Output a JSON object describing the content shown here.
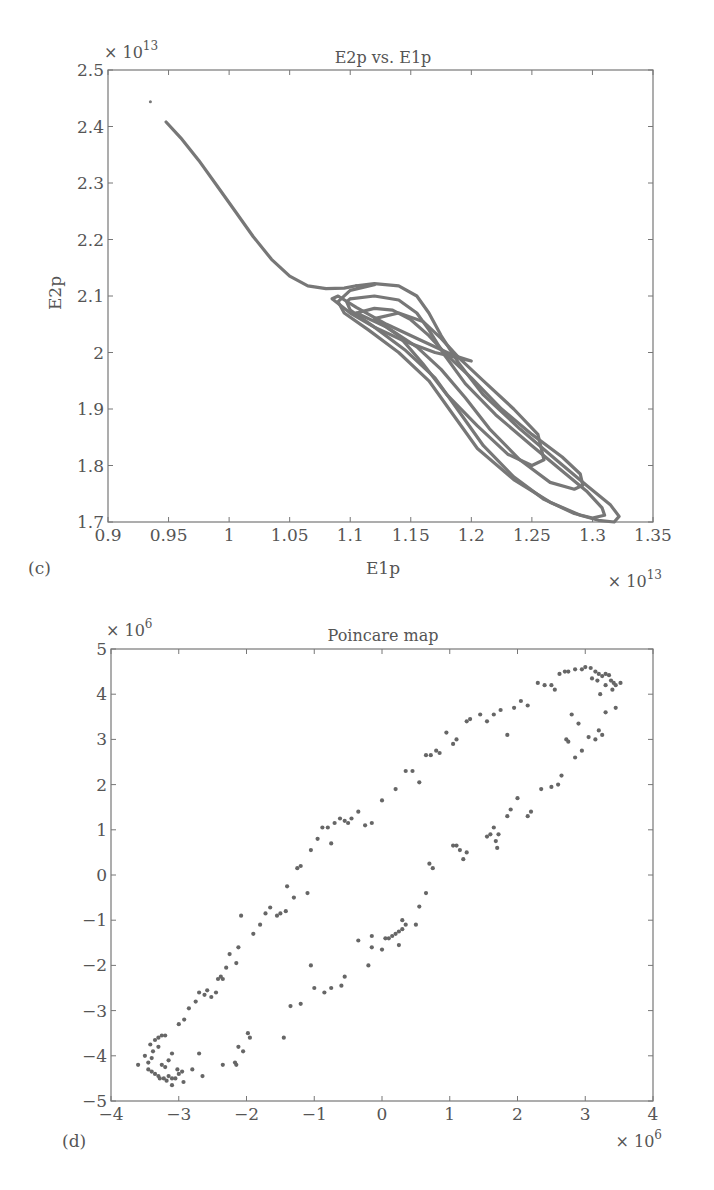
{
  "chart_data": [
    {
      "panel": "(c)",
      "type": "line",
      "title": "E2p vs. E1p",
      "xlabel": "E1p",
      "ylabel": "E2p",
      "x_multiplier": "× 10^13",
      "y_multiplier": "× 10^13",
      "xlim": [
        0.9,
        1.35
      ],
      "ylim": [
        1.7,
        2.5
      ],
      "xticks": [
        0.9,
        0.95,
        1,
        1.05,
        1.1,
        1.15,
        1.2,
        1.25,
        1.3,
        1.35
      ],
      "xtick_labels": [
        "0.9",
        "0.95",
        "1",
        "1.05",
        "1.1",
        "1.15",
        "1.2",
        "1.25",
        "1.3",
        "1.35"
      ],
      "yticks": [
        1.7,
        1.8,
        1.9,
        2.0,
        2.1,
        2.2,
        2.3,
        2.4,
        2.5
      ],
      "ytick_labels": [
        "1.7",
        "1.8",
        "1.9",
        "2",
        "2.1",
        "2.2",
        "2.3",
        "2.4",
        "2.5"
      ],
      "grid": false,
      "color": "#777777",
      "isolated_point": [
        0.935,
        2.444
      ],
      "series": [
        {
          "name": "transient",
          "x": [
            0.948,
            0.96,
            0.975,
            0.99,
            1.005,
            1.02,
            1.035,
            1.05,
            1.065,
            1.08,
            1.095,
            1.105
          ],
          "y": [
            2.408,
            2.38,
            2.34,
            2.295,
            2.25,
            2.205,
            2.165,
            2.135,
            2.118,
            2.113,
            2.114,
            2.118
          ]
        },
        {
          "name": "loop-outer",
          "x": [
            1.105,
            1.12,
            1.14,
            1.155,
            1.165,
            1.175,
            1.19,
            1.21,
            1.24,
            1.27,
            1.295,
            1.315,
            1.322,
            1.318,
            1.305,
            1.29,
            1.265,
            1.235,
            1.205,
            1.185,
            1.165,
            1.14,
            1.115,
            1.095,
            1.09,
            1.1,
            1.12
          ],
          "y": [
            2.118,
            2.122,
            2.118,
            2.1,
            2.07,
            2.03,
            1.98,
            1.925,
            1.865,
            1.81,
            1.765,
            1.73,
            1.71,
            1.7,
            1.703,
            1.712,
            1.735,
            1.775,
            1.83,
            1.89,
            1.95,
            2.0,
            2.04,
            2.07,
            2.09,
            2.11,
            2.12
          ]
        },
        {
          "name": "loop-mid",
          "x": [
            1.1,
            1.12,
            1.14,
            1.155,
            1.165,
            1.178,
            1.195,
            1.22,
            1.25,
            1.275,
            1.295,
            1.308,
            1.31,
            1.3,
            1.285,
            1.26,
            1.235,
            1.21,
            1.19,
            1.17,
            1.145,
            1.12,
            1.1,
            1.097,
            1.1
          ],
          "y": [
            2.095,
            2.1,
            2.093,
            2.07,
            2.04,
            1.995,
            1.945,
            1.89,
            1.835,
            1.79,
            1.755,
            1.725,
            1.712,
            1.707,
            1.715,
            1.74,
            1.78,
            1.835,
            1.895,
            1.955,
            2.005,
            2.045,
            2.075,
            2.09,
            2.095
          ]
        },
        {
          "name": "loop-inner",
          "x": [
            1.105,
            1.12,
            1.135,
            1.15,
            1.165,
            1.18,
            1.2,
            1.225,
            1.25,
            1.275,
            1.29,
            1.292,
            1.285,
            1.265,
            1.24,
            1.215,
            1.195,
            1.175,
            1.155,
            1.13,
            1.11,
            1.105
          ],
          "y": [
            2.07,
            2.078,
            2.075,
            2.058,
            2.03,
            1.995,
            1.955,
            1.9,
            1.855,
            1.815,
            1.785,
            1.765,
            1.758,
            1.77,
            1.81,
            1.865,
            1.92,
            1.97,
            2.01,
            2.045,
            2.065,
            2.07
          ]
        },
        {
          "name": "loop-smallest",
          "x": [
            1.12,
            1.14,
            1.16,
            1.175,
            1.19,
            1.21,
            1.235,
            1.255,
            1.26,
            1.25,
            1.23,
            1.205,
            1.18,
            1.16,
            1.14,
            1.12
          ],
          "y": [
            2.06,
            2.07,
            2.055,
            2.025,
            1.99,
            1.95,
            1.9,
            1.855,
            1.81,
            1.8,
            1.82,
            1.87,
            1.925,
            1.98,
            2.03,
            2.06
          ]
        },
        {
          "name": "loop-fold",
          "x": [
            1.085,
            1.1,
            1.12,
            1.145,
            1.17,
            1.19,
            1.2,
            1.185,
            1.16,
            1.13,
            1.105,
            1.09,
            1.085
          ],
          "y": [
            2.095,
            2.07,
            2.045,
            2.02,
            2.0,
            1.99,
            1.985,
            1.995,
            2.02,
            2.05,
            2.08,
            2.1,
            2.095
          ]
        }
      ]
    },
    {
      "panel": "(d)",
      "type": "scatter",
      "title": "Poincare map",
      "xlabel": "",
      "ylabel": "",
      "x_multiplier": "× 10^6",
      "y_multiplier": "× 10^6",
      "xlim": [
        -4,
        4
      ],
      "ylim": [
        -5,
        5
      ],
      "xticks": [
        -4,
        -3,
        -2,
        -1,
        0,
        1,
        2,
        3,
        4
      ],
      "xtick_labels": [
        "−4",
        "−3",
        "−2",
        "−1",
        "0",
        "1",
        "2",
        "3",
        "4"
      ],
      "yticks": [
        -5,
        -4,
        -3,
        -2,
        -1,
        0,
        1,
        2,
        3,
        4,
        5
      ],
      "ytick_labels": [
        "−5",
        "−4",
        "−3",
        "−2",
        "−1",
        "0",
        "1",
        "2",
        "3",
        "4",
        "5"
      ],
      "grid": false,
      "color": "#666666",
      "points": [
        [
          -3.6,
          -4.2
        ],
        [
          -3.5,
          -4.0
        ],
        [
          -3.45,
          -4.15
        ],
        [
          -3.4,
          -4.05
        ],
        [
          -3.38,
          -3.9
        ],
        [
          -3.35,
          -3.65
        ],
        [
          -3.3,
          -3.6
        ],
        [
          -3.25,
          -3.55
        ],
        [
          -3.2,
          -3.55
        ],
        [
          -3.42,
          -3.75
        ],
        [
          -3.3,
          -3.8
        ],
        [
          -3.45,
          -4.3
        ],
        [
          -3.4,
          -4.35
        ],
        [
          -3.35,
          -4.4
        ],
        [
          -3.3,
          -4.45
        ],
        [
          -3.28,
          -4.5
        ],
        [
          -3.22,
          -4.5
        ],
        [
          -3.18,
          -4.55
        ],
        [
          -3.15,
          -4.45
        ],
        [
          -3.1,
          -4.5
        ],
        [
          -3.05,
          -4.5
        ],
        [
          -3.0,
          -4.4
        ],
        [
          -2.95,
          -4.35
        ],
        [
          -3.1,
          -4.65
        ],
        [
          -2.93,
          -4.58
        ],
        [
          -3.25,
          -4.2
        ],
        [
          -3.2,
          -4.25
        ],
        [
          -3.15,
          -4.1
        ],
        [
          -3.1,
          -3.95
        ],
        [
          -3.02,
          -4.3
        ],
        [
          -2.8,
          -4.3
        ],
        [
          -2.7,
          -3.95
        ],
        [
          -2.65,
          -4.45
        ],
        [
          -3.0,
          -3.3
        ],
        [
          -2.92,
          -3.2
        ],
        [
          -2.85,
          -2.95
        ],
        [
          -2.75,
          -2.8
        ],
        [
          -2.7,
          -2.6
        ],
        [
          -2.62,
          -2.65
        ],
        [
          -2.58,
          -2.55
        ],
        [
          -2.52,
          -2.7
        ],
        [
          -2.45,
          -2.6
        ],
        [
          -2.42,
          -2.3
        ],
        [
          -2.38,
          -2.25
        ],
        [
          -2.35,
          -2.3
        ],
        [
          -2.3,
          -2.05
        ],
        [
          -2.25,
          -1.75
        ],
        [
          -2.15,
          -1.95
        ],
        [
          -2.12,
          -1.6
        ],
        [
          -2.08,
          -0.9
        ],
        [
          -2.35,
          -4.2
        ],
        [
          -2.17,
          -4.15
        ],
        [
          -2.15,
          -4.2
        ],
        [
          -2.12,
          -3.8
        ],
        [
          -2.05,
          -3.9
        ],
        [
          -1.98,
          -3.5
        ],
        [
          -1.95,
          -3.6
        ],
        [
          -1.45,
          -3.6
        ],
        [
          -1.9,
          -1.3
        ],
        [
          -1.8,
          -1.1
        ],
        [
          -1.72,
          -0.85
        ],
        [
          -1.65,
          -0.72
        ],
        [
          -1.55,
          -0.9
        ],
        [
          -1.5,
          -0.85
        ],
        [
          -1.42,
          -0.8
        ],
        [
          -1.4,
          -0.25
        ],
        [
          -1.3,
          -0.5
        ],
        [
          -1.25,
          0.15
        ],
        [
          -1.2,
          0.2
        ],
        [
          -1.1,
          -0.4
        ],
        [
          -1.05,
          0.55
        ],
        [
          -0.95,
          0.8
        ],
        [
          -0.88,
          1.05
        ],
        [
          -0.8,
          1.05
        ],
        [
          -0.75,
          0.7
        ],
        [
          -0.7,
          1.15
        ],
        [
          -0.62,
          1.25
        ],
        [
          -0.55,
          1.2
        ],
        [
          -0.5,
          1.15
        ],
        [
          -0.45,
          1.25
        ],
        [
          -0.35,
          1.4
        ],
        [
          -0.25,
          1.1
        ],
        [
          -0.15,
          1.15
        ],
        [
          0.0,
          1.65
        ],
        [
          0.2,
          1.9
        ],
        [
          0.35,
          2.3
        ],
        [
          0.45,
          2.3
        ],
        [
          0.55,
          2.05
        ],
        [
          0.65,
          2.65
        ],
        [
          0.72,
          2.65
        ],
        [
          0.8,
          2.75
        ],
        [
          0.85,
          2.7
        ],
        [
          0.95,
          3.15
        ],
        [
          1.05,
          2.9
        ],
        [
          1.1,
          3.0
        ],
        [
          1.25,
          3.4
        ],
        [
          1.3,
          3.45
        ],
        [
          1.45,
          3.55
        ],
        [
          1.55,
          3.4
        ],
        [
          1.65,
          3.55
        ],
        [
          1.75,
          3.65
        ],
        [
          1.85,
          3.1
        ],
        [
          1.95,
          3.7
        ],
        [
          2.05,
          3.85
        ],
        [
          2.15,
          3.75
        ],
        [
          2.3,
          4.25
        ],
        [
          2.4,
          4.2
        ],
        [
          2.5,
          4.2
        ],
        [
          2.55,
          4.1
        ],
        [
          2.62,
          4.45
        ],
        [
          2.7,
          4.5
        ],
        [
          2.75,
          4.5
        ],
        [
          2.85,
          4.55
        ],
        [
          2.95,
          4.55
        ],
        [
          3.0,
          4.6
        ],
        [
          3.08,
          4.58
        ],
        [
          3.15,
          4.5
        ],
        [
          3.2,
          4.45
        ],
        [
          3.25,
          4.4
        ],
        [
          3.3,
          4.45
        ],
        [
          3.35,
          4.42
        ],
        [
          3.38,
          4.3
        ],
        [
          3.42,
          4.25
        ],
        [
          3.45,
          4.2
        ],
        [
          3.52,
          4.25
        ],
        [
          3.1,
          4.35
        ],
        [
          3.18,
          4.3
        ],
        [
          3.3,
          4.2
        ],
        [
          3.22,
          4.0
        ],
        [
          3.4,
          4.1
        ],
        [
          3.3,
          3.6
        ],
        [
          3.45,
          3.7
        ],
        [
          3.2,
          3.2
        ],
        [
          3.25,
          3.1
        ],
        [
          3.15,
          3.0
        ],
        [
          3.05,
          3.05
        ],
        [
          2.9,
          3.35
        ],
        [
          2.8,
          3.55
        ],
        [
          2.95,
          2.75
        ],
        [
          2.72,
          3.0
        ],
        [
          2.75,
          2.95
        ],
        [
          2.85,
          2.6
        ],
        [
          2.65,
          2.2
        ],
        [
          2.6,
          2.0
        ],
        [
          2.5,
          1.95
        ],
        [
          2.35,
          1.9
        ],
        [
          2.2,
          1.4
        ],
        [
          2.15,
          1.3
        ],
        [
          2.0,
          1.7
        ],
        [
          1.9,
          1.45
        ],
        [
          1.85,
          1.3
        ],
        [
          1.72,
          0.9
        ],
        [
          1.7,
          0.6
        ],
        [
          1.68,
          0.75
        ],
        [
          1.65,
          1.05
        ],
        [
          1.6,
          0.9
        ],
        [
          1.55,
          0.85
        ],
        [
          1.25,
          0.5
        ],
        [
          1.2,
          0.35
        ],
        [
          1.15,
          0.55
        ],
        [
          1.1,
          0.65
        ],
        [
          1.05,
          0.65
        ],
        [
          0.75,
          0.15
        ],
        [
          0.7,
          0.25
        ],
        [
          0.65,
          -0.4
        ],
        [
          0.55,
          -0.7
        ],
        [
          0.5,
          -1.1
        ],
        [
          0.35,
          -1.1
        ],
        [
          0.3,
          -1.0
        ],
        [
          0.25,
          -1.25
        ],
        [
          0.2,
          -1.3
        ],
        [
          0.15,
          -1.35
        ],
        [
          0.1,
          -1.4
        ],
        [
          0.05,
          -1.4
        ],
        [
          0.3,
          -1.2
        ],
        [
          0.25,
          -1.55
        ],
        [
          0.0,
          -1.65
        ],
        [
          -0.15,
          -1.35
        ],
        [
          -0.15,
          -1.6
        ],
        [
          -0.2,
          -2.0
        ],
        [
          -0.35,
          -1.45
        ],
        [
          -0.55,
          -2.25
        ],
        [
          -0.6,
          -2.45
        ],
        [
          -0.75,
          -2.5
        ],
        [
          -0.85,
          -2.6
        ],
        [
          -1.0,
          -2.5
        ],
        [
          -1.05,
          -2.0
        ],
        [
          -1.2,
          -2.85
        ],
        [
          -1.35,
          -2.9
        ]
      ]
    }
  ]
}
